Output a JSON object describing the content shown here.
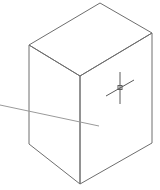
{
  "viewport": {
    "background": "#ffffff",
    "line_color": "#6e6e6e"
  },
  "scene": {
    "object": "isometric-box",
    "view": "SE isometric"
  },
  "cursor": {
    "type": "crosshair-with-pickbox",
    "color": "#5a5a5a"
  },
  "guide_line": {
    "type": "rubber-band-line",
    "color": "#9a9a9a"
  }
}
